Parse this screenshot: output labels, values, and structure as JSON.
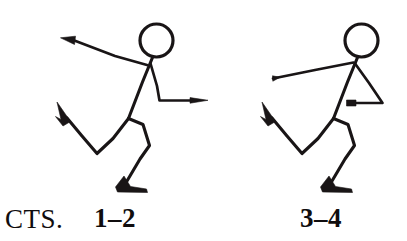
{
  "page": {
    "background_color": "#ffffff",
    "ink_color": "#191516",
    "width": 407,
    "height": 241
  },
  "captions": {
    "label": "CTS.",
    "count_1_label": "1–2",
    "count_2_label": "3–4"
  },
  "figures": [
    {
      "id": "figure-left",
      "count_label": "1–2",
      "description": "Stick figure leaning forward, one arm raised back-left with pointed hand, other arm bent forward extending right with pointed hand, back leg lifted with pointed toe, front leg bent standing on a solid foot.",
      "parts": [
        "head",
        "torso",
        "back-arm-raised",
        "front-arm-bent",
        "lifted-leg",
        "standing-leg",
        "pointed-toe",
        "standing-foot"
      ]
    },
    {
      "id": "figure-right",
      "count_label": "3–4",
      "description": "Stick figure in matching pose, one arm reaching back-left with blunt hand, other arm bent into a triangle with forearm drawn back toward the body, back leg lifted with pointed toe, front leg bent standing on a solid foot.",
      "parts": [
        "head",
        "torso",
        "back-arm-reaching",
        "front-arm-triangle",
        "lifted-leg",
        "standing-leg",
        "pointed-toe",
        "standing-foot"
      ]
    }
  ]
}
